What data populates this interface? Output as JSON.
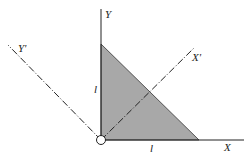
{
  "diagram": {
    "type": "coordinate-rotation-figure",
    "axes": [
      {
        "name": "X",
        "label": "X"
      },
      {
        "name": "Y",
        "label": "Y"
      },
      {
        "name": "X-prime",
        "label": "X'",
        "style": "dash-dot"
      },
      {
        "name": "Y-prime",
        "label": "Y'",
        "style": "dash-dot"
      }
    ],
    "dimensions": {
      "vertical_leg": "l",
      "horizontal_leg": "l"
    },
    "shape": {
      "kind": "right-triangle",
      "fill": "#a8a8a8"
    },
    "origin": {
      "marker": "hollow-circle"
    }
  },
  "labels": {
    "x": "X",
    "y": "Y",
    "x_prime": "X'",
    "y_prime": "Y'",
    "leg_vertical": "l",
    "leg_horizontal": "l"
  },
  "colors": {
    "fill": "#a8a8a8",
    "stroke": "#222222"
  }
}
